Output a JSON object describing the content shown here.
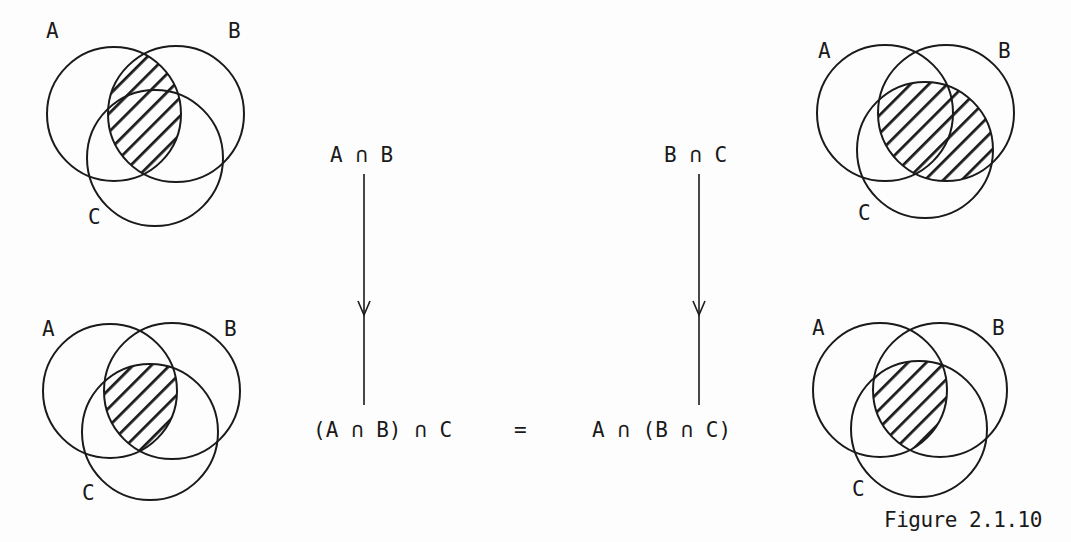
{
  "figure": {
    "caption": "Figure 2.1.10",
    "colors": {
      "ink": "#1a1a1a",
      "background": "#fdfdfd"
    },
    "diagrams": [
      {
        "position": "top-left",
        "shaded_region": "A ∩ B",
        "labels": {
          "a": "A",
          "b": "B",
          "c": "C"
        }
      },
      {
        "position": "top-right",
        "shaded_region": "B ∩ C",
        "labels": {
          "a": "A",
          "b": "B",
          "c": "C"
        }
      },
      {
        "position": "bottom-left",
        "shaded_region": "(A ∩ B) ∩ C",
        "labels": {
          "a": "A",
          "b": "B",
          "c": "C"
        }
      },
      {
        "position": "bottom-right",
        "shaded_region": "A ∩ (B ∩ C)",
        "labels": {
          "a": "A",
          "b": "B",
          "c": "C"
        }
      }
    ],
    "expressions": {
      "top_left": "A ∩ B",
      "top_right": "B ∩ C",
      "bottom_left": "(A ∩ B) ∩ C",
      "equals": "=",
      "bottom_right": "A ∩ (B ∩ C)"
    }
  }
}
